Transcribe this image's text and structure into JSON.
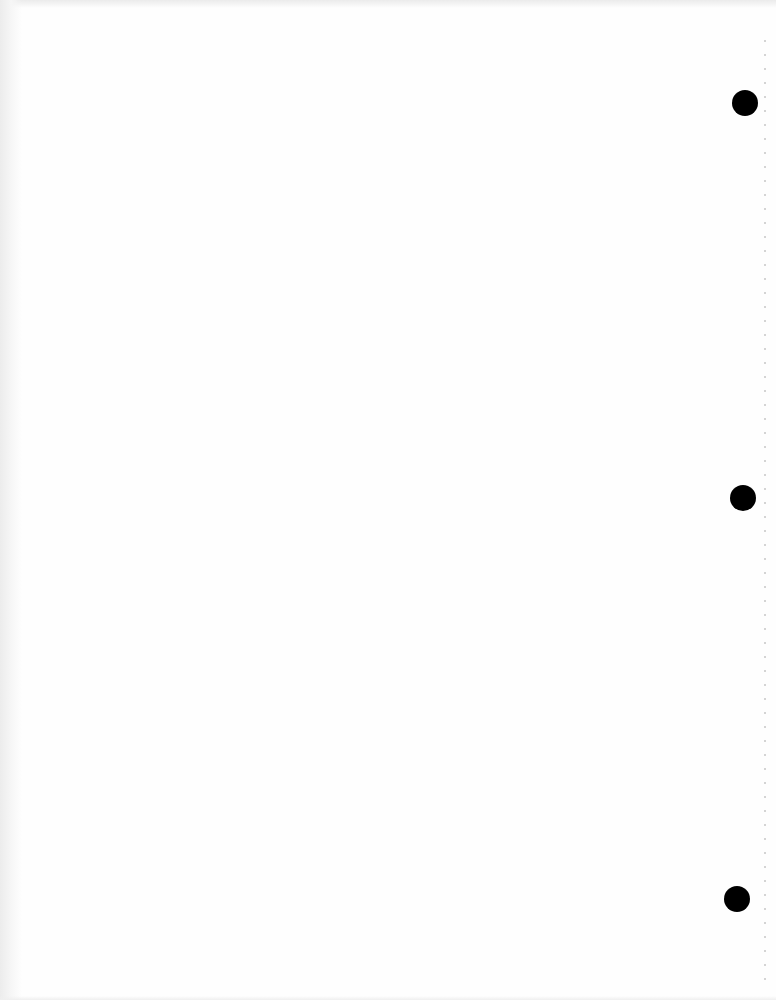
{
  "document": {
    "type": "blank scanned page",
    "text": "",
    "punch_holes": 3,
    "colors": {
      "paper": "#fefefe",
      "hole": "#000000",
      "edge_shadow": "#ececec"
    }
  }
}
